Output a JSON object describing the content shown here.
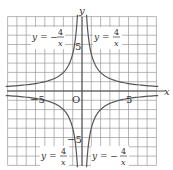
{
  "chart_data": {
    "type": "line",
    "title": "",
    "xlabel": "x",
    "ylabel": "y",
    "origin_label": "O",
    "xlim": [
      -8,
      8
    ],
    "ylim": [
      -8,
      8
    ],
    "grid": true,
    "ticks": {
      "x": [
        {
          "value": -5,
          "label": "−5"
        },
        {
          "value": 5,
          "label": "5"
        }
      ],
      "y": [
        {
          "value": 5,
          "label": "5"
        },
        {
          "value": -5,
          "label": "−5"
        }
      ]
    },
    "series": [
      {
        "name": "y = 4/x",
        "formula": "y=4/x",
        "k": 4,
        "quadrants": [
          1,
          3
        ]
      },
      {
        "name": "y = −4/x",
        "formula": "y=-4/x",
        "k": -4,
        "quadrants": [
          2,
          4
        ]
      }
    ],
    "annotations": [
      {
        "text_left": "y = −",
        "num": "4",
        "den": "x",
        "position": "top-left"
      },
      {
        "text_left": "y = ",
        "num": "4",
        "den": "x",
        "position": "top-right"
      },
      {
        "text_left": "y = ",
        "num": "4",
        "den": "x",
        "position": "bottom-left"
      },
      {
        "text_left": "y = −",
        "num": "4",
        "den": "x",
        "position": "bottom-right"
      }
    ]
  },
  "colors": {
    "grid": "#9a9a9a",
    "axis": "#444444",
    "curve": "#555555"
  }
}
